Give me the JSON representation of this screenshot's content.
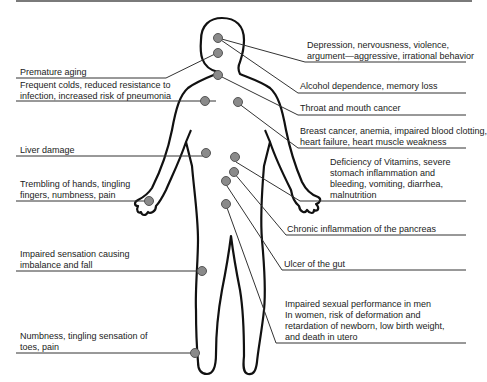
{
  "diagram": {
    "title": "",
    "left_labels": [
      {
        "id": "premature-aging",
        "text": "Premature aging"
      },
      {
        "id": "frequent-colds",
        "line1": "Frequent colds, reduced resistance to",
        "line2": "infection, increased risk of pneumonia"
      },
      {
        "id": "liver",
        "text": "Liver damage"
      },
      {
        "id": "trembling",
        "line1": "Trembling of hands, tingling",
        "line2": "fingers, numbness, pain"
      },
      {
        "id": "impaired-sensation",
        "line1": "Impaired sensation causing",
        "line2": "imbalance and fall"
      },
      {
        "id": "numbness-toes",
        "line1": "Numbness, tingling sensation of",
        "line2": "toes, pain"
      }
    ],
    "right_labels": [
      {
        "id": "depression",
        "line1": "Depression, nervousness, violence,",
        "line2": "argument—aggressive, irrational behavior"
      },
      {
        "id": "alcohol-dependence",
        "text": "Alcohol dependence, memory loss"
      },
      {
        "id": "throat",
        "text": "Throat and mouth cancer"
      },
      {
        "id": "breast",
        "line1": "Breast cancer, anemia, impaired blood clotting,",
        "line2": "heart failure, heart muscle weakness"
      },
      {
        "id": "vitamins",
        "line1": "Deficiency of Vitamins, severe",
        "line2": "stomach inflammation and",
        "line3": "bleeding, vomiting, diarrhea,",
        "line4": "malnutrition"
      },
      {
        "id": "pancreas",
        "text": "Chronic inflammation of the pancreas"
      },
      {
        "id": "ulcer",
        "text": "Ulcer of the gut"
      },
      {
        "id": "sexual",
        "line1": "Impaired sexual performance in men",
        "line2": "In women, risk of deformation and",
        "line3": "retardation of newborn, low birth weight,",
        "line4": "and death in utero"
      }
    ],
    "colors": {
      "dot": "#8a8a8a",
      "dot_stroke": "#555555",
      "line": "#333333",
      "outline": "#111111"
    }
  }
}
